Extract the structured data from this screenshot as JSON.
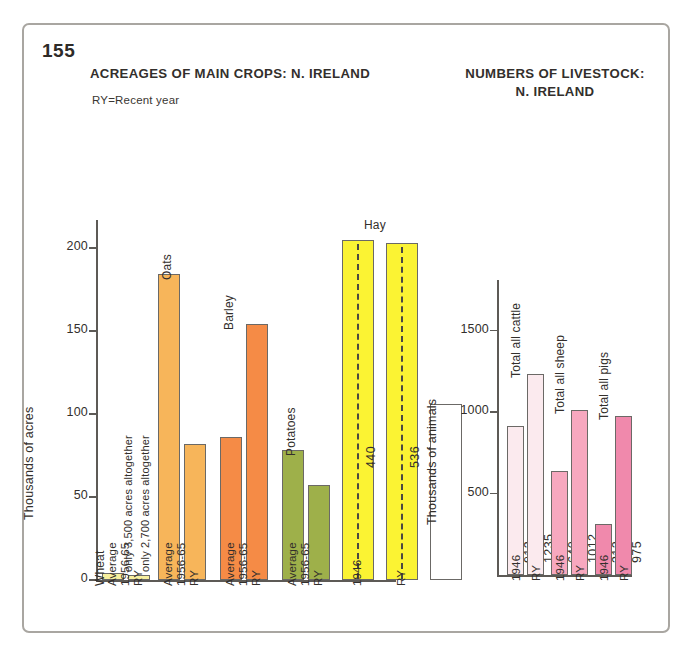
{
  "page": {
    "number": "155"
  },
  "left_chart": {
    "title": "ACREAGES OF MAIN CROPS: N. IRELAND",
    "note": "RY=Recent year",
    "ylabel": "Thousands of acres",
    "yticks": [
      "0",
      "50",
      "100",
      "150",
      "200"
    ],
    "crop_labels": [
      "Wheat",
      "Oats",
      "Barley",
      "Potatoes",
      "Hay"
    ],
    "wheat_notes": [
      "only 3,500 acres altogether",
      "only 2,700 acres altogether"
    ],
    "hay_values": [
      "440",
      "536"
    ],
    "xcats": [
      "Average",
      "1956-65",
      "RY",
      "Average",
      "1956-65",
      "RY",
      "Average",
      "1956-65",
      "RY",
      "Average",
      "1956-65",
      "RY",
      "1946",
      "RY"
    ]
  },
  "right_chart": {
    "title": "NUMBERS OF LIVESTOCK: N. IRELAND",
    "ylabel": "Thousands of animals",
    "yticks": [
      "500",
      "1000",
      "1500"
    ],
    "group_labels": [
      "Total all cattle",
      "Total all sheep",
      "Total all pigs"
    ],
    "values": [
      "913",
      "1235",
      "640",
      "1012",
      "312",
      "975"
    ],
    "xcats": [
      "1946",
      "RY",
      "1946",
      "RY",
      "1946",
      "RY"
    ]
  },
  "chart_data": [
    {
      "type": "bar",
      "title": "ACREAGES OF MAIN CROPS: N. IRELAND",
      "subtitle": "RY=Recent year",
      "xlabel": "",
      "ylabel": "Thousands of acres",
      "ylim": [
        0,
        215
      ],
      "yticks": [
        0,
        50,
        100,
        150,
        200
      ],
      "grid": false,
      "legend": "none",
      "note": "Hay bars are broken/truncated; their true values 440 and 536 are printed inside the bars along a dashed line.",
      "categories": [
        "Wheat Average 1956-65",
        "Wheat RY",
        "Oats Average 1956-65",
        "Oats RY",
        "Barley Average 1956-65",
        "Barley RY",
        "Potatoes Average 1956-65",
        "Potatoes RY",
        "Hay 1946",
        "Hay RY"
      ],
      "values": [
        4,
        3,
        184,
        82,
        86,
        154,
        78,
        57,
        440,
        536
      ],
      "displayed_bar_heights": [
        4,
        3,
        184,
        82,
        86,
        154,
        78,
        57,
        205,
        203
      ],
      "groups": [
        {
          "crop": "Wheat",
          "color": "#f7ef9e",
          "categories": [
            "Average 1956-65",
            "RY"
          ],
          "values": [
            4,
            3
          ],
          "annotations": [
            "only 3,500 acres altogether",
            "only 2,700 acres altogether"
          ]
        },
        {
          "crop": "Oats",
          "color": "#f7b55a",
          "categories": [
            "Average 1956-65",
            "RY"
          ],
          "values": [
            184,
            82
          ]
        },
        {
          "crop": "Barley",
          "color": "#f58b46",
          "categories": [
            "Average 1956-65",
            "RY"
          ],
          "values": [
            86,
            154
          ]
        },
        {
          "crop": "Potatoes",
          "color": "#9eb04a",
          "categories": [
            "Average 1956-65",
            "RY"
          ],
          "values": [
            78,
            57
          ]
        },
        {
          "crop": "Hay",
          "color": "#fbf333",
          "categories": [
            "1946",
            "RY"
          ],
          "values": [
            440,
            536
          ],
          "truncated": true,
          "secondary_bar_value": 106
        }
      ]
    },
    {
      "type": "bar",
      "title": "NUMBERS OF LIVESTOCK: N. IRELAND",
      "xlabel": "",
      "ylabel": "Thousands of animals",
      "ylim": [
        0,
        1700
      ],
      "yticks": [
        500,
        1000,
        1500
      ],
      "grid": false,
      "legend": "none",
      "categories": [
        "Cattle 1946",
        "Cattle RY",
        "Sheep 1946",
        "Sheep RY",
        "Pigs 1946",
        "Pigs RY"
      ],
      "values": [
        913,
        1235,
        640,
        1012,
        312,
        975
      ],
      "groups": [
        {
          "animal": "Total all cattle",
          "color": "#fbeaee",
          "categories": [
            "1946",
            "RY"
          ],
          "values": [
            913,
            1235
          ]
        },
        {
          "animal": "Total all sheep",
          "color": "#f7a8bf",
          "categories": [
            "1946",
            "RY"
          ],
          "values": [
            640,
            1012
          ]
        },
        {
          "animal": "Total all pigs",
          "color": "#f089ac",
          "categories": [
            "1946",
            "RY"
          ],
          "values": [
            312,
            975
          ]
        }
      ]
    }
  ]
}
